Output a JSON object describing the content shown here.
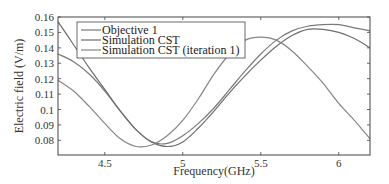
{
  "chart_data": {
    "type": "line",
    "title": "",
    "xlabel": "Frequency(GHz)",
    "ylabel": "Electric field (V/m)",
    "xlim": [
      4.2,
      6.2
    ],
    "ylim": [
      0.0705,
      0.16
    ],
    "xticks": [
      4.5,
      5,
      5.5,
      6
    ],
    "xtick_labels": [
      "4.5",
      "5",
      "5.5",
      "6"
    ],
    "yticks": [
      0.08,
      0.09,
      0.1,
      0.11,
      0.12,
      0.13,
      0.14,
      0.15,
      0.16
    ],
    "ytick_labels": [
      "0.08",
      "0.09",
      "0.1",
      "0.11",
      "0.12",
      "0.13",
      "0.14",
      "0.15",
      "0.16"
    ],
    "grid": false,
    "legend_position": "upper left",
    "series": [
      {
        "name": "Objective 1",
        "color": "#7a7a7a",
        "x": [
          4.2,
          4.3,
          4.4,
          4.5,
          4.6,
          4.7,
          4.8,
          4.9,
          5.0,
          5.1,
          5.2,
          5.3,
          5.4,
          5.5,
          5.6,
          5.7,
          5.8,
          5.9,
          6.0,
          6.1,
          6.2
        ],
        "y": [
          0.136,
          0.131,
          0.123,
          0.112,
          0.099,
          0.087,
          0.079,
          0.078,
          0.083,
          0.091,
          0.101,
          0.113,
          0.125,
          0.136,
          0.145,
          0.151,
          0.154,
          0.155,
          0.155,
          0.153,
          0.151
        ]
      },
      {
        "name": "Simulation CST",
        "color": "#6e6e6e",
        "x": [
          4.2,
          4.3,
          4.4,
          4.5,
          4.6,
          4.7,
          4.8,
          4.9,
          5.0,
          5.1,
          5.2,
          5.3,
          5.4,
          5.5,
          5.6,
          5.7,
          5.8,
          5.9,
          6.0,
          6.1,
          6.2
        ],
        "y": [
          0.157,
          0.142,
          0.127,
          0.113,
          0.099,
          0.087,
          0.079,
          0.076,
          0.079,
          0.088,
          0.099,
          0.111,
          0.122,
          0.132,
          0.141,
          0.148,
          0.152,
          0.152,
          0.15,
          0.146,
          0.14
        ]
      },
      {
        "name": "Simulation CST (iteration 1)",
        "color": "#858585",
        "x": [
          4.2,
          4.3,
          4.4,
          4.5,
          4.6,
          4.7,
          4.8,
          4.9,
          5.0,
          5.1,
          5.2,
          5.3,
          5.4,
          5.5,
          5.6,
          5.7,
          5.8,
          5.9,
          6.0,
          6.1,
          6.2
        ],
        "y": [
          0.119,
          0.112,
          0.102,
          0.091,
          0.081,
          0.076,
          0.077,
          0.083,
          0.093,
          0.107,
          0.123,
          0.136,
          0.145,
          0.147,
          0.145,
          0.138,
          0.128,
          0.117,
          0.104,
          0.093,
          0.081
        ]
      }
    ]
  }
}
